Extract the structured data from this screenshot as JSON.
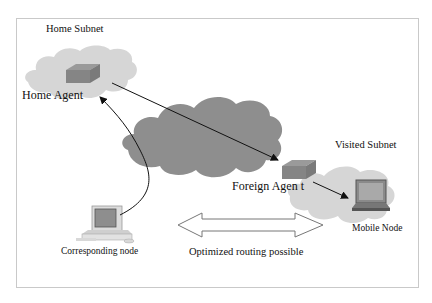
{
  "diagram": {
    "labels": {
      "home_subnet": "Home Subnet",
      "home_agent": "Home Agent",
      "visited_subnet": "Visited Subnet",
      "foreign_agent": "Foreign Agen t",
      "mobile_node": "Mobile Node",
      "corresponding_node": "Corresponding node",
      "optimized_routing": "Optimized routing possible"
    },
    "nodes": [
      {
        "id": "home-agent",
        "type": "router",
        "subnet": "Home Subnet"
      },
      {
        "id": "foreign-agent",
        "type": "router",
        "subnet": "Visited Subnet"
      },
      {
        "id": "mobile-node",
        "type": "laptop",
        "subnet": "Visited Subnet"
      },
      {
        "id": "corresponding-node",
        "type": "desktop-computer"
      },
      {
        "id": "internet",
        "type": "cloud"
      }
    ],
    "edges": [
      {
        "from": "home-agent",
        "to": "foreign-agent",
        "style": "arrow"
      },
      {
        "from": "foreign-agent",
        "to": "mobile-node",
        "style": "arrow"
      },
      {
        "from": "corresponding-node",
        "to": "home-agent",
        "style": "curved-arrow"
      },
      {
        "from": "corresponding-node",
        "to": "mobile-node",
        "style": "double-arrow",
        "label": "Optimized routing possible"
      }
    ],
    "colors": {
      "subnet_cloud": "#d6d6d6",
      "internet_cloud": "#8e8e8e",
      "router_top": "#9a9a9a",
      "router_side": "#7d7d7d",
      "line": "#111111",
      "frame": "#c9c9c9"
    }
  }
}
